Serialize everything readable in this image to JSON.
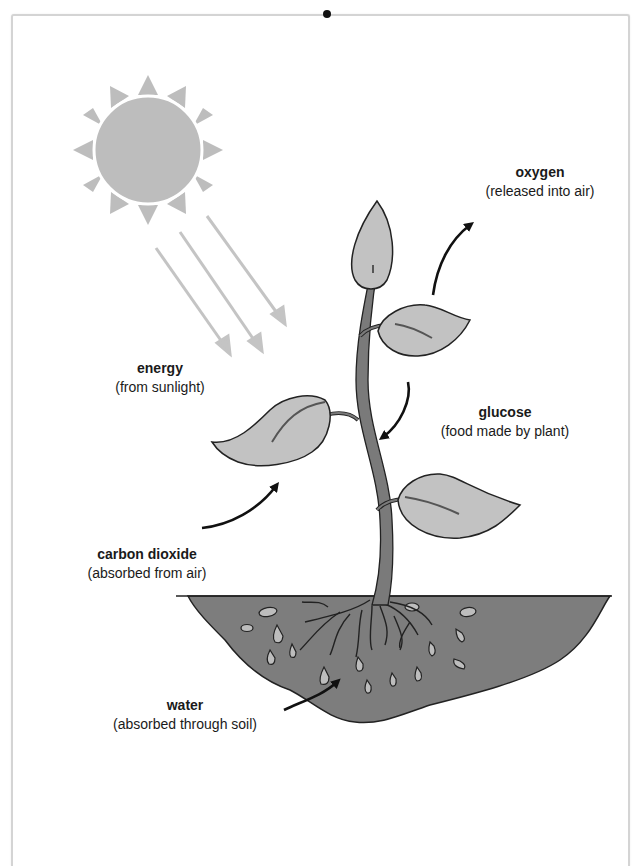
{
  "diagram": {
    "type": "photosynthesis",
    "colors": {
      "sun": "#bdbdbd",
      "light_rays": "#c4c4c4",
      "leaf_fill": "#c2c2c2",
      "stem": "#7a7a7a",
      "soil": "#7d7d7d",
      "water_drops": "#bdbdbd",
      "arrows": "#111111",
      "frame_border": "#d4d4d4"
    },
    "labels": {
      "oxygen": {
        "term": "oxygen",
        "desc": "(released into air)"
      },
      "energy": {
        "term": "energy",
        "desc": "(from sunlight)"
      },
      "glucose": {
        "term": "glucose",
        "desc": "(food made by plant)"
      },
      "carbon_dioxide": {
        "term": "carbon dioxide",
        "desc": "(absorbed from air)"
      },
      "water": {
        "term": "water",
        "desc": "(absorbed through soil)"
      }
    }
  }
}
